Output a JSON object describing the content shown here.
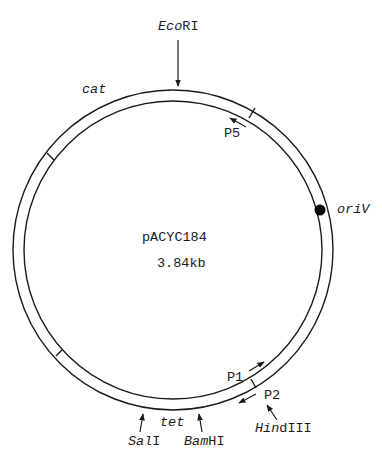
{
  "plasmid": {
    "name": "pACYC184",
    "size": "3.84kb"
  },
  "genes": {
    "cat": "cat",
    "tet": "tet"
  },
  "origin": {
    "label_italic": "oriV"
  },
  "promoters": {
    "p1": "P1",
    "p2": "P2",
    "p5": "P5"
  },
  "sites": {
    "ecori": {
      "italic": "Eco",
      "roman": "RI"
    },
    "sali": {
      "italic": "Sal",
      "roman": "I"
    },
    "bamhi": {
      "italic": "Bam",
      "roman": "HI"
    },
    "hindiii": {
      "italic": "Hin",
      "roman": "dIII"
    }
  },
  "colors": {
    "line": "#1a1a1a",
    "background": "#ffffff"
  }
}
